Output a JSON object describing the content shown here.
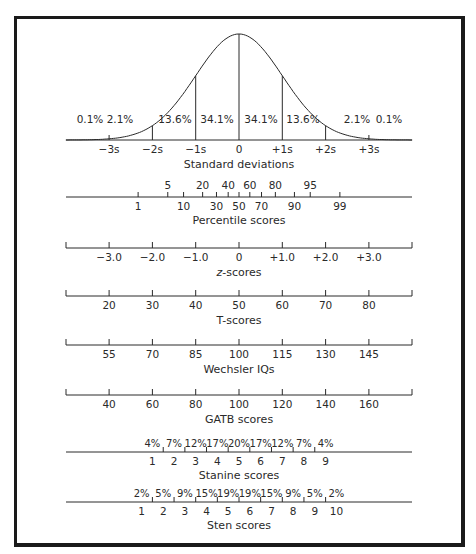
{
  "chart_data": {
    "type": "line",
    "title": "",
    "curve": {
      "xlabel": "Standard deviations",
      "ticks": [
        "−3s",
        "−2s",
        "−1s",
        "0",
        "+1s",
        "+2s",
        "+3s"
      ],
      "tick_values": [
        -3,
        -2,
        -1,
        0,
        1,
        2,
        3
      ],
      "area_percents": [
        "0.1%",
        "2.1%",
        "13.6%",
        "34.1%",
        "34.1%",
        "13.6%",
        "2.1%",
        "0.1%"
      ]
    },
    "scales": [
      {
        "name": "percentile",
        "title": "Percentile scores",
        "upper_labels": [
          "5",
          "20",
          "40",
          "60",
          "80",
          "95"
        ],
        "upper_z": [
          -1.645,
          -0.84,
          -0.25,
          0.25,
          0.84,
          1.645
        ],
        "lower_labels": [
          "1",
          "10",
          "30",
          "50",
          "70",
          "90",
          "99"
        ],
        "lower_z": [
          -2.33,
          -1.28,
          -0.52,
          0,
          0.52,
          1.28,
          2.33
        ]
      },
      {
        "name": "z",
        "title": "z-scores",
        "labels": [
          "−3.0",
          "−2.0",
          "−1.0",
          "0",
          "+1.0",
          "+2.0",
          "+3.0"
        ],
        "z": [
          -3,
          -2,
          -1,
          0,
          1,
          2,
          3
        ]
      },
      {
        "name": "t",
        "title": "T-scores",
        "labels": [
          "20",
          "30",
          "40",
          "50",
          "60",
          "70",
          "80"
        ],
        "z": [
          -3,
          -2,
          -1,
          0,
          1,
          2,
          3
        ]
      },
      {
        "name": "wechsler",
        "title": "Wechsler IQs",
        "labels": [
          "55",
          "70",
          "85",
          "100",
          "115",
          "130",
          "145"
        ],
        "z": [
          -3,
          -2,
          -1,
          0,
          1,
          2,
          3
        ]
      },
      {
        "name": "gatb",
        "title": "GATB scores",
        "labels": [
          "40",
          "60",
          "80",
          "100",
          "120",
          "140",
          "160"
        ],
        "z": [
          -3,
          -2,
          -1,
          0,
          1,
          2,
          3
        ]
      },
      {
        "name": "stanine",
        "title": "Stanine scores",
        "labels": [
          "1",
          "2",
          "3",
          "4",
          "5",
          "6",
          "7",
          "8",
          "9"
        ],
        "percents": [
          "4%",
          "7%",
          "12%",
          "17%",
          "20%",
          "17%",
          "12%",
          "7%",
          "4%"
        ],
        "center_z": [
          -2,
          -1.5,
          -1,
          -0.5,
          0,
          0.5,
          1,
          1.5,
          2
        ],
        "boundary_z": [
          -1.75,
          -1.25,
          -0.75,
          -0.25,
          0.25,
          0.75,
          1.25,
          1.75
        ]
      },
      {
        "name": "sten",
        "title": "Sten scores",
        "labels": [
          "1",
          "2",
          "3",
          "4",
          "5",
          "6",
          "7",
          "8",
          "9",
          "10"
        ],
        "percents": [
          "2%",
          "5%",
          "9%",
          "15%",
          "19%",
          "19%",
          "15%",
          "9%",
          "5%",
          "2%"
        ],
        "center_z": [
          -2.25,
          -1.75,
          -1.25,
          -0.75,
          -0.25,
          0.25,
          0.75,
          1.25,
          1.75,
          2.25
        ],
        "boundary_z": [
          -2,
          -1.5,
          -1,
          -0.5,
          0,
          0.5,
          1,
          1.5,
          2
        ]
      }
    ],
    "colors": {
      "ink": "#2a2a2a",
      "frame": "#1a1a1a",
      "background": "#ffffff"
    }
  }
}
